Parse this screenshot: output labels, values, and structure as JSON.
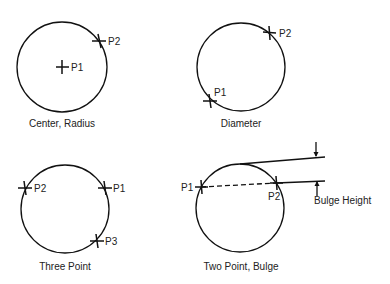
{
  "diagram": {
    "panels": [
      {
        "caption": "Center, Radius",
        "points": [
          {
            "label": "P1",
            "role": "center"
          },
          {
            "label": "P2",
            "role": "on-circle"
          }
        ]
      },
      {
        "caption": "Diameter",
        "points": [
          {
            "label": "P1",
            "role": "diameter-end"
          },
          {
            "label": "P2",
            "role": "diameter-end"
          }
        ]
      },
      {
        "caption": "Three Point",
        "points": [
          {
            "label": "P1",
            "role": "on-circle"
          },
          {
            "label": "P2",
            "role": "on-circle"
          },
          {
            "label": "P3",
            "role": "on-circle"
          }
        ]
      },
      {
        "caption": "Two Point, Bulge",
        "points": [
          {
            "label": "P1",
            "role": "chord-end"
          },
          {
            "label": "P2",
            "role": "chord-end"
          }
        ],
        "dimension_label": "Bulge Height"
      }
    ]
  }
}
